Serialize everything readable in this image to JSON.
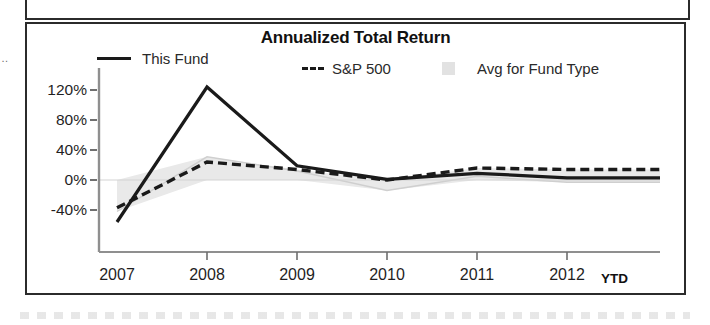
{
  "chart_data": {
    "type": "line",
    "title": "Annualized Total Return",
    "xlabel": "",
    "ylabel": "",
    "grid": false,
    "legend_position": "top",
    "x": [
      "2007",
      "2008",
      "2009",
      "2010",
      "2011",
      "2012"
    ],
    "x_suffix_label": "YTD",
    "categories": [
      "2007",
      "2008",
      "2009",
      "2010",
      "2011",
      "2012"
    ],
    "xtick_labels": [
      "2007",
      "2008",
      "2009",
      "2010",
      "2011",
      "2012"
    ],
    "ytick_labels": [
      "120%",
      "80%",
      "40%",
      "0%",
      "-40%"
    ],
    "ytick_values": [
      120,
      80,
      40,
      0,
      -40
    ],
    "ylim": [
      -60,
      135
    ],
    "series": [
      {
        "name": "This Fund",
        "style": "solid",
        "color": "#1a1a1a",
        "values": [
          -56,
          124,
          19,
          1,
          9,
          3
        ]
      },
      {
        "name": "S&P 500",
        "style": "dashed",
        "color": "#1a1a1a",
        "values": [
          -37,
          24,
          14,
          0,
          16,
          14
        ]
      },
      {
        "name": "Avg for Fund Type",
        "style": "band",
        "color": "#e2e2e2",
        "values": [
          -42,
          31,
          12,
          -14,
          5,
          -3
        ]
      }
    ]
  },
  "chart": {
    "title": "Annualized Total Return",
    "legend": [
      {
        "label": "This Fund",
        "swatch": "solid-line-swatch"
      },
      {
        "label": "S&P 500",
        "swatch": "dashed-line-swatch"
      },
      {
        "label": "Avg for Fund Type",
        "swatch": "shaded-band-swatch"
      }
    ],
    "y_axis": {
      "ticks": [
        "120%",
        "80%",
        "40%",
        "0%",
        "-40%"
      ]
    },
    "x_axis": {
      "ticks": [
        "2007",
        "2008",
        "2009",
        "2010",
        "2011",
        "2012"
      ],
      "suffix": "YTD"
    }
  },
  "artifacts": {
    "left_glyph": "…",
    "left_glyph_2": "∙"
  }
}
